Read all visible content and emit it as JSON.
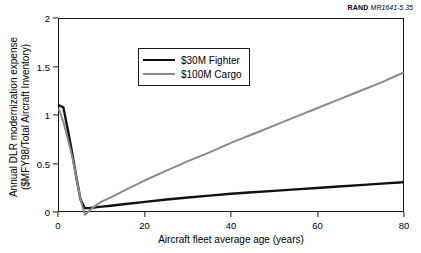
{
  "credit": {
    "org": "RAND",
    "report": "MR1641-5.35"
  },
  "chart_data": {
    "type": "line",
    "title": "",
    "xlabel": "Aircraft fleet average age (years)",
    "ylabel_line1": "Annual DLR modernization expense",
    "ylabel_line2": "($MFY98/Total Aircraft Inventory)",
    "xlim": [
      0,
      80
    ],
    "ylim": [
      0,
      2
    ],
    "xticks": [
      0,
      20,
      40,
      60,
      80
    ],
    "xticklabels": [
      "0",
      "20",
      "40",
      "60",
      "80"
    ],
    "yticks": [
      0,
      0.5,
      1,
      1.5,
      2
    ],
    "yticklabels": [
      "0",
      "0.5",
      "1",
      "1.5",
      "2"
    ],
    "grid": false,
    "legend_position": "upper-left",
    "series": [
      {
        "name": "$30M Fighter",
        "color": "#111111",
        "x": [
          0,
          1,
          2,
          3,
          4,
          5,
          6,
          7,
          8,
          10,
          12,
          15,
          20,
          25,
          30,
          35,
          40,
          45,
          50,
          55,
          60,
          65,
          70,
          75,
          80
        ],
        "y": [
          1.1,
          1.08,
          0.86,
          0.62,
          0.36,
          0.12,
          0.03,
          0.03,
          0.035,
          0.045,
          0.055,
          0.07,
          0.095,
          0.12,
          0.14,
          0.16,
          0.18,
          0.195,
          0.21,
          0.225,
          0.24,
          0.255,
          0.27,
          0.285,
          0.3
        ]
      },
      {
        "name": "$100M Cargo",
        "color": "#8a8a8a",
        "x": [
          0,
          1,
          2,
          3,
          4,
          5,
          6,
          7,
          8,
          10,
          12,
          15,
          20,
          25,
          30,
          35,
          40,
          45,
          50,
          55,
          60,
          65,
          70,
          75,
          80
        ],
        "y": [
          1.06,
          0.93,
          0.76,
          0.58,
          0.36,
          0.12,
          -0.04,
          0.0,
          0.04,
          0.1,
          0.14,
          0.21,
          0.32,
          0.42,
          0.52,
          0.61,
          0.71,
          0.8,
          0.89,
          0.98,
          1.07,
          1.16,
          1.25,
          1.34,
          1.44
        ]
      }
    ]
  }
}
